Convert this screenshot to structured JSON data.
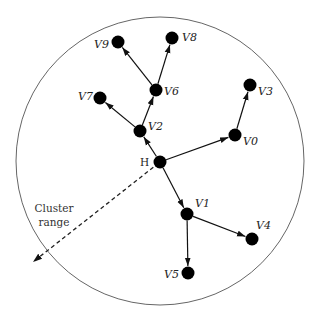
{
  "diagram": {
    "type": "cluster-tree",
    "boundary": {
      "cx": 160,
      "cy": 161,
      "r": 144,
      "stroke": "#666666"
    },
    "cluster_range_label": [
      "Cluster",
      "range"
    ],
    "cluster_range_arrow": {
      "from": "H",
      "to": [
        33,
        262
      ]
    },
    "nodes": [
      {
        "id": "H",
        "label": "H",
        "x": 160,
        "y": 162,
        "label_dx": -20,
        "label_dy": 4
      },
      {
        "id": "V0",
        "label": "V0",
        "x": 235,
        "y": 135,
        "label_dx": 8,
        "label_dy": 10
      },
      {
        "id": "V1",
        "label": "V1",
        "x": 187,
        "y": 214,
        "label_dx": 8,
        "label_dy": -7
      },
      {
        "id": "V2",
        "label": "V2",
        "x": 140,
        "y": 131,
        "label_dx": 8,
        "label_dy": -1
      },
      {
        "id": "V3",
        "label": "V3",
        "x": 250,
        "y": 85,
        "label_dx": 8,
        "label_dy": 10
      },
      {
        "id": "V4",
        "label": "V4",
        "x": 252,
        "y": 239,
        "label_dx": 4,
        "label_dy": -10
      },
      {
        "id": "V5",
        "label": "V5",
        "x": 188,
        "y": 273,
        "label_dx": -24,
        "label_dy": 5
      },
      {
        "id": "V6",
        "label": "V6",
        "x": 156,
        "y": 90,
        "label_dx": 8,
        "label_dy": 5
      },
      {
        "id": "V7",
        "label": "V7",
        "x": 100,
        "y": 98,
        "label_dx": -22,
        "label_dy": 2
      },
      {
        "id": "V8",
        "label": "V8",
        "x": 172,
        "y": 38,
        "label_dx": 10,
        "label_dy": 3
      },
      {
        "id": "V9",
        "label": "V9",
        "x": 118,
        "y": 42,
        "label_dx": -24,
        "label_dy": 6
      }
    ],
    "edges": [
      {
        "from": "H",
        "to": "V0"
      },
      {
        "from": "H",
        "to": "V1"
      },
      {
        "from": "H",
        "to": "V2"
      },
      {
        "from": "V0",
        "to": "V3"
      },
      {
        "from": "V1",
        "to": "V4"
      },
      {
        "from": "V1",
        "to": "V5"
      },
      {
        "from": "V2",
        "to": "V6"
      },
      {
        "from": "V2",
        "to": "V7"
      },
      {
        "from": "V6",
        "to": "V8"
      },
      {
        "from": "V6",
        "to": "V9"
      }
    ],
    "node_radius": 6.5,
    "node_color": "#000000",
    "edge_color": "#111111"
  }
}
